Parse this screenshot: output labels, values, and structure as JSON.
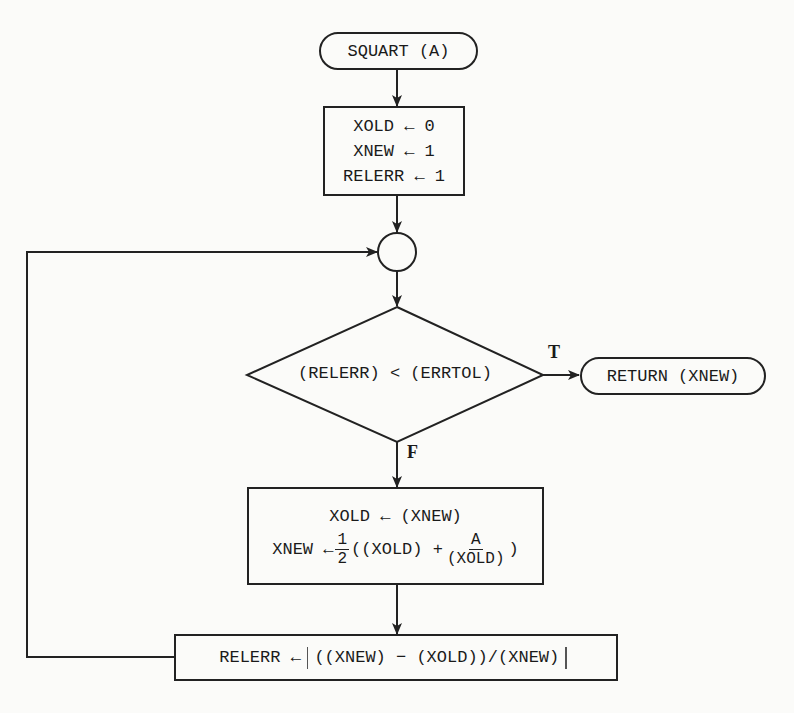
{
  "colors": {
    "background": "#fbfbf9",
    "stroke": "#222222",
    "text": "#1a1a1a"
  },
  "start": {
    "label": "SQUART (A)"
  },
  "init": {
    "lines": [
      "XOLD ← 0",
      "XNEW ← 1",
      "RELERR ← 1"
    ]
  },
  "junction": {
    "label": ""
  },
  "decision": {
    "condition": "(RELERR) < (ERRTOL)",
    "true_label": "T",
    "false_label": "F"
  },
  "end": {
    "label": "RETURN (XNEW)"
  },
  "update": {
    "line1": "XOLD ← (XNEW)",
    "line2_lhs": "XNEW ←",
    "frac1_num": "1",
    "frac1_den": "2",
    "line2_mid": "((XOLD) +",
    "frac2_num": "A",
    "frac2_den": "(XOLD)",
    "line2_close": ")"
  },
  "relerr": {
    "lhs": "RELERR ←",
    "expr": "((XNEW) − (XOLD))/(XNEW)"
  }
}
